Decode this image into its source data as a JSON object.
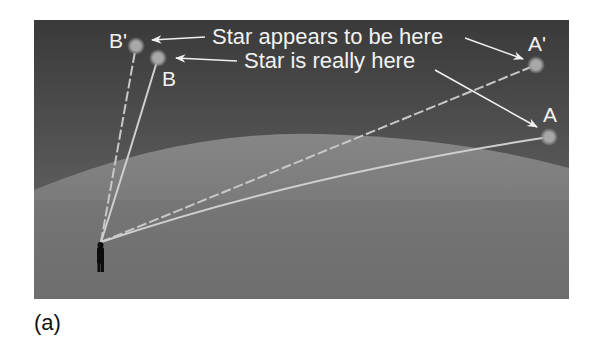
{
  "figure": {
    "caption": "(a)",
    "background_color": "#ffffff",
    "panel": {
      "x": 34,
      "y": 20,
      "width": 535,
      "height": 279,
      "sky_top_color": "#3c3c3c",
      "sky_bottom_color": "#6e6e6e",
      "atmosphere_color": "#8a8a8a"
    },
    "callouts": {
      "apparent": "Star appears to be here",
      "real": "Star is really here"
    },
    "stars": [
      {
        "id": "B_prime",
        "label": "B'",
        "kind": "apparent",
        "x": 136,
        "y": 46
      },
      {
        "id": "B",
        "label": "B",
        "kind": "real",
        "x": 158,
        "y": 58
      },
      {
        "id": "A_prime",
        "label": "A'",
        "kind": "apparent",
        "x": 536,
        "y": 65
      },
      {
        "id": "A",
        "label": "A",
        "kind": "real",
        "x": 549,
        "y": 137
      }
    ],
    "observer": {
      "x": 101,
      "y": 242
    }
  }
}
